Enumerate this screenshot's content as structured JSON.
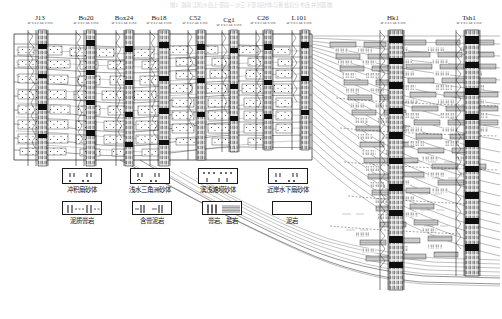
{
  "figure": {
    "title": "图1 渤南洼陷沙四上亚段—沙三下亚段砂体与膏盐岩分布连井剖面图",
    "type": "well-log-cross-section"
  },
  "wells": [
    {
      "name": "J13",
      "curves": "SP 0 0.2  GR 0 150",
      "x": 40,
      "track_w": 26
    },
    {
      "name": "Bo20",
      "curves": "SP 0 0.2  GR 0 150",
      "x": 86,
      "track_w": 26
    },
    {
      "name": "Box24",
      "curves": "SP 0 0.2  GR 0 150",
      "x": 124,
      "track_w": 26
    },
    {
      "name": "Bo18",
      "curves": "SP 0 0.2  GR 0 150",
      "x": 159,
      "track_w": 26
    },
    {
      "name": "C52",
      "curves": "SP 0 0.2  GR 0 150",
      "x": 195,
      "track_w": 24
    },
    {
      "name": "Cg1",
      "curves": "SP 0 0.2  GR 0 150",
      "x": 228,
      "track_w": 22
    },
    {
      "name": "C26",
      "curves": "SP 0 0.2  GR 0 150",
      "x": 262,
      "track_w": 24
    },
    {
      "name": "L101",
      "curves": "SP 0 0.2  GR 0 150",
      "x": 299,
      "track_w": 24
    },
    {
      "name": "Hk1",
      "curves": "SP 0 0.2  GR 0 150",
      "x": 392,
      "track_w": 30
    },
    {
      "name": "Tsh1",
      "curves": "SP 0 0.2  GR 0 150",
      "x": 467,
      "track_w": 30
    }
  ],
  "legend": {
    "row1": [
      {
        "label": "冲积扇砂体",
        "pattern": "alluvial-fan-sand"
      },
      {
        "label": "浅水三角洲砂体",
        "pattern": "shallow-delta-sand"
      },
      {
        "label": "滨浅滩坝砂体",
        "pattern": "beach-bar-sand"
      },
      {
        "label": "近岸水下扇砂体",
        "pattern": "nearshore-subaqueous-fan-sand"
      }
    ],
    "row2": [
      {
        "label": "泥质膏岩",
        "pattern": "argillaceous-gypsum"
      },
      {
        "label": "含膏泥岩",
        "pattern": "gypsiferous-mudstone"
      },
      {
        "label": "膏岩、盐岩",
        "pattern": "gypsum-salt-rock"
      },
      {
        "label": "泥岩",
        "pattern": "mudstone"
      }
    ]
  },
  "colors": {
    "ink": "#111111",
    "line": "#333333",
    "fill_gray": "#b8b8b8",
    "fill_light": "#d9d9d9",
    "paper": "#ffffff",
    "title_faint": "#d6d6dc"
  }
}
